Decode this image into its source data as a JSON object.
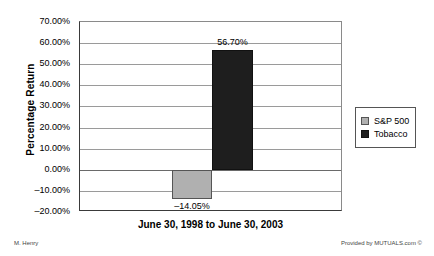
{
  "chart_data": {
    "type": "bar",
    "title": "",
    "xlabel": "June 30, 1998 to June 30, 2003",
    "ylabel": "Percentage Return",
    "categories": [
      "S&P 500",
      "Tobacco"
    ],
    "values": [
      -14.05,
      56.7
    ],
    "value_labels": [
      "–14.05%",
      "56.70%"
    ],
    "ylim": [
      -20,
      70
    ],
    "ytick_values": [
      70,
      60,
      50,
      40,
      30,
      20,
      10,
      0,
      -10,
      -20
    ],
    "ytick_labels": [
      "70.00%",
      "60.00%",
      "50.00%",
      "40.00%",
      "30.00%",
      "20.00%",
      "10.00%",
      "0.00%",
      "–10.00%",
      "–20.00%"
    ],
    "grid": true,
    "legend_position": "right",
    "series": [
      {
        "name": "S&P 500",
        "value": -14.05,
        "color": "#b0b0b0"
      },
      {
        "name": "Tobacco",
        "value": 56.7,
        "color": "#1e1e1e"
      }
    ]
  },
  "legend": {
    "items": [
      {
        "label": "S&P 500"
      },
      {
        "label": "Tobacco"
      }
    ]
  },
  "footer": {
    "author": "M. Henry",
    "credit": "Provided by MUTUALS.com ©"
  }
}
